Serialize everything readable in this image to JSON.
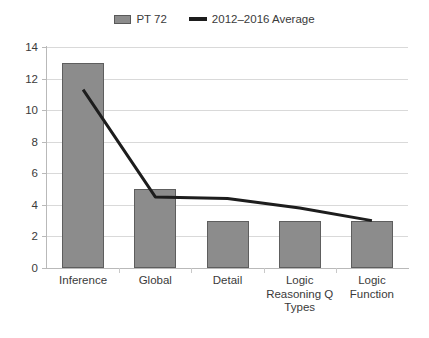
{
  "legend": {
    "entries": [
      {
        "label": "PT 72",
        "marker": "bar-swatch",
        "color": "#8c8c8c"
      },
      {
        "label": "2012–2016 Average",
        "marker": "line-swatch",
        "color": "#1d1d1d"
      }
    ]
  },
  "axes": {
    "y_ticks": [
      "14",
      "12",
      "10",
      "8",
      "6",
      "4",
      "2",
      "0"
    ]
  },
  "chart_data": {
    "type": "bar",
    "title": "",
    "subtitle": "",
    "xlabel": "",
    "ylabel": "",
    "ylim": [
      0,
      14
    ],
    "ytick_values": [
      0,
      2,
      4,
      6,
      8,
      10,
      12,
      14
    ],
    "grid": "horizontal",
    "legend_position": "top-center",
    "categories": [
      "Inference",
      "Global",
      "Detail",
      "Logic Reasoning Q Types",
      "Logic Function"
    ],
    "category_label_lines": [
      [
        "Inference"
      ],
      [
        "Global"
      ],
      [
        "Detail"
      ],
      [
        "Logic",
        "Reasoning Q",
        "Types"
      ],
      [
        "Logic",
        "Function"
      ]
    ],
    "series": [
      {
        "name": "PT 72",
        "type": "bar",
        "color": "#8c8c8c",
        "edge_color": "#5e5e5e",
        "values": [
          13,
          5,
          3,
          3,
          3
        ]
      },
      {
        "name": "2012–2016 Average",
        "type": "line",
        "color": "#1d1d1d",
        "line_width": 3,
        "values": [
          11.3,
          4.5,
          4.4,
          3.8,
          3.0
        ]
      }
    ]
  }
}
